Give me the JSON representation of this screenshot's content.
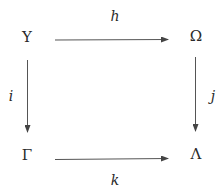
{
  "diagram": {
    "type": "commutative-square",
    "nodes": {
      "top_left": {
        "symbol": "Υ",
        "x": 27,
        "y": 37
      },
      "top_right": {
        "symbol": "Ω",
        "x": 196,
        "y": 36
      },
      "bottom_left": {
        "symbol": "Γ",
        "x": 27,
        "y": 155
      },
      "bottom_right": {
        "symbol": "Λ",
        "x": 196,
        "y": 154
      }
    },
    "arrows": {
      "top": {
        "label": "h",
        "from": "Υ",
        "to": "Ω",
        "label_x": 115,
        "label_y": 16
      },
      "bottom": {
        "label": "k",
        "from": "Γ",
        "to": "Λ",
        "label_x": 115,
        "label_y": 180
      },
      "left": {
        "label": "i",
        "from": "Υ",
        "to": "Γ",
        "label_x": 11,
        "label_y": 96
      },
      "right": {
        "label": "j",
        "from": "Ω",
        "to": "Λ",
        "label_x": 213,
        "label_y": 96
      }
    },
    "colors": {
      "line": "#555555",
      "text": "#2a2a2a",
      "background": "#ffffff"
    }
  }
}
